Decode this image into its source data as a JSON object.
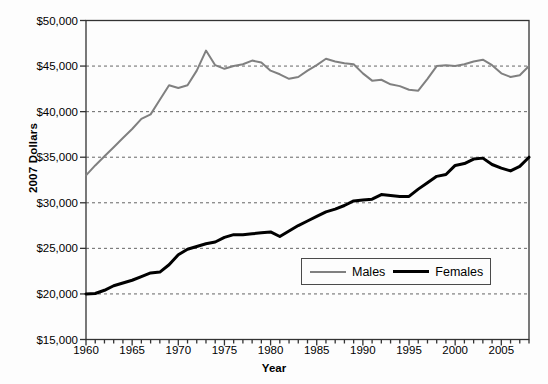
{
  "chart_data": {
    "type": "line",
    "title": "",
    "xlabel": "Year",
    "ylabel": "2007 Dollars",
    "xlim": [
      1960,
      2008
    ],
    "ylim": [
      15000,
      50000
    ],
    "y_tick_labels": [
      "$50,000",
      "$45,000",
      "$40,000",
      "$35,000",
      "$30,000",
      "$25,000",
      "$20,000",
      "$15,000"
    ],
    "y_tick_values": [
      50000,
      45000,
      40000,
      35000,
      30000,
      25000,
      20000,
      15000
    ],
    "x_tick_labels": [
      "1960",
      "1965",
      "1970",
      "1975",
      "1980",
      "1985",
      "1990",
      "1995",
      "2000",
      "2005"
    ],
    "x_tick_values": [
      1960,
      1965,
      1970,
      1975,
      1980,
      1985,
      1990,
      1995,
      2000,
      2005
    ],
    "x_minor_tick_interval": 1,
    "grid": "horizontal-dashed",
    "legend_position": "inside-lower-right",
    "x": [
      1960,
      1961,
      1962,
      1963,
      1964,
      1965,
      1966,
      1967,
      1968,
      1969,
      1970,
      1971,
      1972,
      1973,
      1974,
      1975,
      1976,
      1977,
      1978,
      1979,
      1980,
      1981,
      1982,
      1983,
      1984,
      1985,
      1986,
      1987,
      1988,
      1989,
      1990,
      1991,
      1992,
      1993,
      1994,
      1995,
      1996,
      1997,
      1998,
      1999,
      2000,
      2001,
      2002,
      2003,
      2004,
      2005,
      2006,
      2007,
      2008
    ],
    "series": [
      {
        "name": "Males",
        "color": "#808080",
        "line_width": 2,
        "values": [
          33000,
          34100,
          35100,
          36100,
          37100,
          38100,
          39200,
          39700,
          41300,
          42900,
          42600,
          42900,
          44500,
          46700,
          45100,
          44700,
          45000,
          45200,
          45600,
          45400,
          44500,
          44100,
          43600,
          43800,
          44500,
          45100,
          45800,
          45500,
          45300,
          45200,
          44200,
          43400,
          43500,
          43000,
          42800,
          42400,
          42300,
          43600,
          45000,
          45100,
          45000,
          45200,
          45500,
          45700,
          45100,
          44200,
          43800,
          44000,
          45000
        ]
      },
      {
        "name": "Females",
        "color": "#000000",
        "line_width": 3,
        "values": [
          20000,
          20050,
          20400,
          20900,
          21200,
          21500,
          21900,
          22300,
          22400,
          23200,
          24300,
          24900,
          25200,
          25500,
          25700,
          26200,
          26500,
          26500,
          26600,
          26700,
          26800,
          26300,
          26900,
          27500,
          28000,
          28500,
          29000,
          29300,
          29700,
          30200,
          30300,
          30400,
          30900,
          30800,
          30700,
          30700,
          31500,
          32200,
          32900,
          33100,
          34100,
          34300,
          34800,
          34900,
          34200,
          33800,
          33500,
          34000,
          35000
        ]
      }
    ]
  },
  "legend": {
    "items": [
      {
        "label": "Males",
        "color": "#808080"
      },
      {
        "label": "Females",
        "color": "#000000"
      }
    ]
  },
  "axes": {
    "y_title": "2007 Dollars",
    "x_title": "Year"
  }
}
